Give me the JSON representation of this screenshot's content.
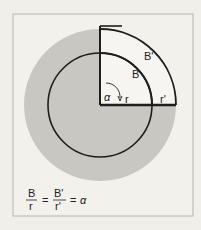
{
  "diagram": {
    "labels": {
      "arc_inner": "B",
      "arc_outer": "B'",
      "angle": "α",
      "radius_inner": "r",
      "radius_outer": "r'"
    },
    "formula": {
      "num1": "B",
      "den1": "r",
      "eq1": "=",
      "num2": "B'",
      "den2": "r'",
      "eq2": "=",
      "result": "α"
    },
    "colors": {
      "background": "#f1efe9",
      "shaded": "#c9c7c2",
      "line": "#1e1e1e"
    }
  }
}
